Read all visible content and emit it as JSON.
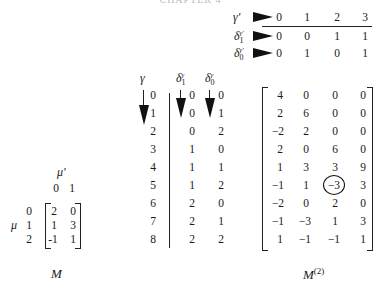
{
  "page_header": "CHAPTER 4",
  "top_table": {
    "rows": [
      {
        "label": "γ'",
        "label_base": "γ'",
        "values": [
          "0",
          "1",
          "2",
          "3"
        ]
      },
      {
        "label_base": "δ",
        "label_sub": "1",
        "label_sup": "γ'",
        "values": [
          "0",
          "0",
          "1",
          "1"
        ]
      },
      {
        "label_base": "δ",
        "label_sub": "0",
        "label_sup": "γ'",
        "values": [
          "0",
          "1",
          "0",
          "1"
        ]
      }
    ]
  },
  "index_table": {
    "headers": {
      "gamma": "γ",
      "delta1_base": "δ",
      "delta1_sub": "1",
      "delta1_sup": "γ",
      "delta0_base": "δ",
      "delta0_sub": "0",
      "delta0_sup": "γ"
    },
    "gamma": [
      "0",
      "1",
      "2",
      "3",
      "4",
      "5",
      "6",
      "7",
      "8"
    ],
    "delta1": [
      "0",
      "0",
      "0",
      "1",
      "1",
      "1",
      "2",
      "2",
      "2"
    ],
    "delta0": [
      "0",
      "1",
      "2",
      "0",
      "1",
      "2",
      "0",
      "1",
      "2"
    ]
  },
  "matrix_M": {
    "col_label": "μ'",
    "col_indices": [
      "0",
      "1"
    ],
    "row_label": "μ",
    "row_indices": [
      "0",
      "1",
      "2"
    ],
    "rows": [
      [
        "2",
        "0"
      ],
      [
        "1",
        "3"
      ],
      [
        "-1",
        "1"
      ]
    ],
    "caption": "M"
  },
  "matrix_M2": {
    "rows": [
      [
        "4",
        "0",
        "0",
        "0"
      ],
      [
        "2",
        "6",
        "0",
        "0"
      ],
      [
        "−2",
        "2",
        "0",
        "0"
      ],
      [
        "2",
        "0",
        "6",
        "0"
      ],
      [
        "1",
        "3",
        "3",
        "9"
      ],
      [
        "−1",
        "1",
        "−3",
        "3"
      ],
      [
        "−2",
        "0",
        "2",
        "0"
      ],
      [
        "−1",
        "−3",
        "1",
        "3"
      ],
      [
        "1",
        "−1",
        "−1",
        "1"
      ]
    ],
    "circled_cell": {
      "row": 5,
      "col": 2,
      "value": "−3"
    },
    "caption_base": "M",
    "caption_sup": "(2)"
  }
}
